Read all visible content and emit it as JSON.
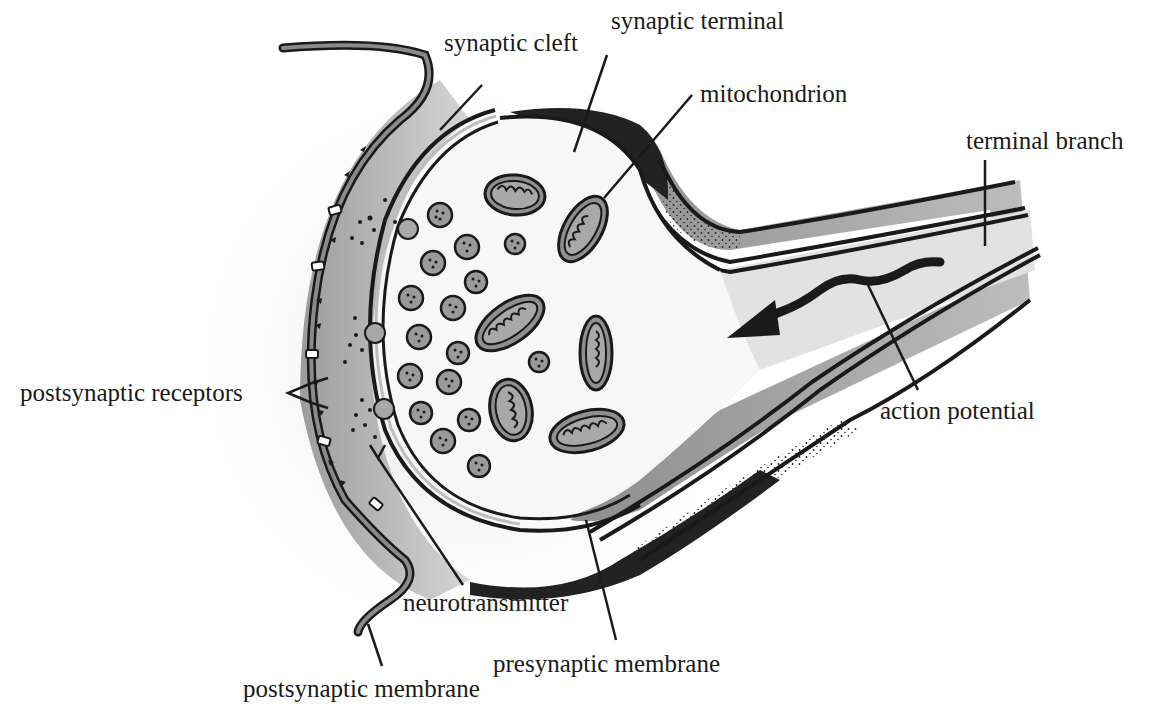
{
  "diagram": {
    "type": "synapse-cross-section",
    "colors": {
      "ink": "#1a1a1a",
      "membrane_fill": "#8a8a8a",
      "cleft_gray": "#b8b8b8",
      "axon_gray": "#9a9a9a",
      "interior": "#f6f6f6",
      "dark_sheath": "#222222"
    },
    "labels": {
      "synaptic_cleft": "synaptic cleft",
      "synaptic_terminal": "synaptic terminal",
      "mitochondrion": "mitochondrion",
      "terminal_branch": "terminal branch",
      "postsynaptic_receptors": "postsynaptic receptors",
      "action_potential": "action potential",
      "neurotransmitter": "neurotransmitter",
      "presynaptic_membrane": "presynaptic membrane",
      "postsynaptic_membrane": "postsynaptic membrane"
    },
    "structures": {
      "mitochondria_count": 6,
      "vesicle_count": 20,
      "receptor_count": 5
    }
  }
}
